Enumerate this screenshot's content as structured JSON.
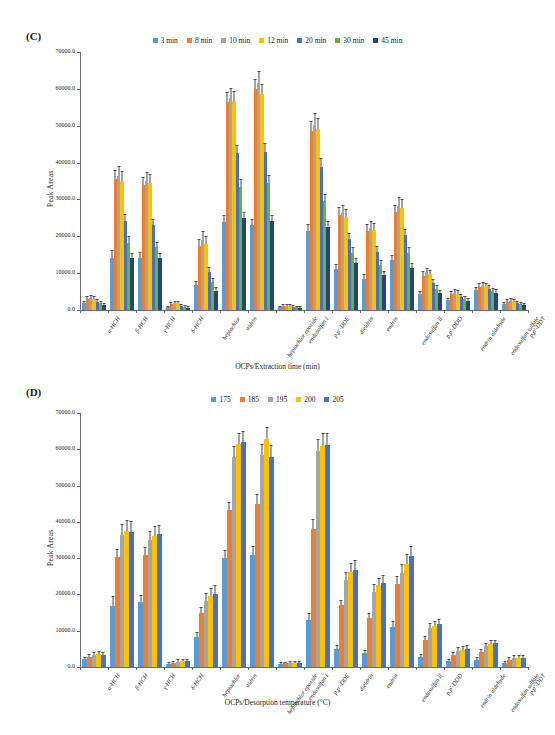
{
  "figure": {
    "panels": [
      {
        "label": "(C)",
        "xlabel": "OCPs/Extraction time (min)",
        "ylabel": "Peak Areas"
      },
      {
        "label": "(D)",
        "xlabel": "OCPs/Desorption temperature (°C)",
        "ylabel": "Peak Areas"
      }
    ]
  },
  "chart_data": [
    {
      "type": "bar",
      "panel": "(C)",
      "title": "",
      "xlabel": "OCPs/Extraction time (min)",
      "ylabel": "Peak Areas",
      "ylim": [
        0,
        70000
      ],
      "yticks": [
        "0.0",
        "10000.0",
        "20000.0",
        "30000.0",
        "40000.0",
        "50000.0",
        "60000.0",
        "70000.0"
      ],
      "grid": false,
      "legend_position": "top-center",
      "categories": [
        "α-HCH",
        "β-HCH",
        "γ-HCH",
        "δ-HCH",
        "heptachlor",
        "aldrin",
        "heptachlor epoxide",
        "endosulfan I",
        "p,p'-DDE",
        "dieldrin",
        "endrin",
        "endosulfan II",
        "p,p'-DDD",
        "endrin aldehyde",
        "endosulfan sulfate",
        "p,p'-DDT"
      ],
      "series": [
        {
          "name": "3 min",
          "color": "#5b9bd5",
          "values": [
            1900,
            14200,
            14200,
            700,
            6800,
            24000,
            23000,
            700,
            21500,
            11000,
            8500,
            13500,
            4300,
            2600,
            5300,
            1500
          ],
          "errors": [
            400,
            1900,
            1400,
            200,
            900,
            1500,
            1400,
            200,
            1500,
            1200,
            900,
            1100,
            500,
            400,
            600,
            300
          ]
        },
        {
          "name": "8 min",
          "color": "#ed7d31",
          "values": [
            3000,
            35500,
            34000,
            1700,
            17500,
            56500,
            60000,
            1100,
            48500,
            25800,
            21500,
            26500,
            9300,
            4300,
            6300,
            2300
          ],
          "errors": [
            500,
            2200,
            1900,
            300,
            1600,
            2400,
            2500,
            250,
            2600,
            1800,
            1500,
            1800,
            900,
            600,
            700,
            400
          ]
        },
        {
          "name": "10 min",
          "color": "#a5a5a5",
          "values": [
            3200,
            36300,
            35000,
            1900,
            19000,
            57500,
            61500,
            1200,
            50200,
            26200,
            22300,
            28300,
            10200,
            4600,
            6600,
            2500
          ],
          "errors": [
            500,
            2600,
            2200,
            350,
            2100,
            2600,
            3000,
            250,
            3000,
            2000,
            1600,
            2200,
            1000,
            700,
            800,
            450
          ]
        },
        {
          "name": "12 min",
          "color": "#ffc000",
          "values": [
            3100,
            35000,
            34500,
            1800,
            18000,
            56800,
            58500,
            1100,
            49000,
            25200,
            21800,
            27800,
            9700,
            4400,
            6400,
            2400
          ],
          "errors": [
            450,
            2400,
            2000,
            300,
            1800,
            2400,
            2600,
            250,
            2700,
            1900,
            1500,
            2000,
            950,
            650,
            750,
            400
          ]
        },
        {
          "name": "20 min",
          "color": "#4472c4",
          "values": [
            2200,
            24200,
            23000,
            1100,
            10200,
            42500,
            43000,
            900,
            38800,
            19200,
            15800,
            20300,
            7300,
            3500,
            5700,
            1900
          ],
          "errors": [
            400,
            1700,
            1500,
            250,
            1100,
            2000,
            2000,
            200,
            2100,
            1500,
            1200,
            1500,
            800,
            550,
            700,
            350
          ]
        },
        {
          "name": "30 min",
          "color": "#70ad47",
          "values": [
            1800,
            18200,
            17000,
            900,
            7600,
            33500,
            34500,
            700,
            29500,
            15500,
            12200,
            15500,
            5800,
            3000,
            5100,
            1600
          ],
          "errors": [
            350,
            1500,
            1300,
            200,
            900,
            1800,
            1800,
            180,
            1800,
            1300,
            1000,
            1300,
            700,
            500,
            650,
            300
          ]
        },
        {
          "name": "45 min",
          "color": "#264478",
          "values": [
            1400,
            14000,
            14200,
            600,
            5100,
            25000,
            24200,
            600,
            22500,
            12800,
            9600,
            11500,
            4500,
            2500,
            4700,
            1300
          ],
          "errors": [
            300,
            1200,
            1100,
            180,
            800,
            1400,
            1400,
            150,
            1500,
            1100,
            800,
            1000,
            600,
            450,
            600,
            280
          ]
        }
      ]
    },
    {
      "type": "bar",
      "panel": "(D)",
      "title": "",
      "xlabel": "OCPs/Desorption temperature (°C)",
      "ylabel": "Peak Areas",
      "ylim": [
        0,
        70000
      ],
      "yticks": [
        "0.0",
        "10000.0",
        "20000.0",
        "30000.0",
        "40000.0",
        "50000.0",
        "60000.0",
        "70000.0"
      ],
      "grid": false,
      "legend_position": "top-center",
      "categories": [
        "α-HCH",
        "β-HCH",
        "γ-HCH",
        "δ-HCH",
        "heptachlor",
        "aldrin",
        "heptachlor epoxide",
        "endosulfan I",
        "p,p'-DDE",
        "dieldrin",
        "endrin",
        "endosulfan II",
        "p,p'-DDD",
        "endrin aldehyde",
        "endosulfan sulfate",
        "p,p'-DDT"
      ],
      "series": [
        {
          "name": "175",
          "color": "#5b9bd5",
          "values": [
            2200,
            16800,
            17800,
            900,
            8300,
            30000,
            31000,
            900,
            13000,
            5000,
            3800,
            11000,
            2800,
            1700,
            2000,
            1000
          ],
          "errors": [
            400,
            2600,
            1800,
            200,
            1100,
            2100,
            2200,
            200,
            1600,
            900,
            700,
            1400,
            500,
            300,
            400,
            250
          ]
        },
        {
          "name": "185",
          "color": "#ed7d31",
          "values": [
            2800,
            30200,
            30800,
            1200,
            14800,
            43200,
            45000,
            1000,
            38000,
            17000,
            13500,
            23000,
            7500,
            3300,
            4200,
            2000
          ],
          "errors": [
            450,
            2000,
            2000,
            250,
            1400,
            2000,
            2300,
            200,
            2500,
            1300,
            1000,
            1800,
            800,
            500,
            600,
            400
          ]
        },
        {
          "name": "195",
          "color": "#a5a5a5",
          "values": [
            3300,
            36500,
            35000,
            1500,
            18300,
            58000,
            58500,
            1100,
            59500,
            24000,
            20800,
            26000,
            10800,
            4500,
            5700,
            2500
          ],
          "errors": [
            500,
            2600,
            2300,
            300,
            1800,
            2600,
            2800,
            250,
            3000,
            2000,
            1700,
            2200,
            1000,
            650,
            750,
            450
          ]
        },
        {
          "name": "200",
          "color": "#ffc000",
          "values": [
            3500,
            37500,
            36200,
            1600,
            19500,
            61500,
            62800,
            1200,
            61000,
            26200,
            22500,
            28500,
            11300,
            4800,
            6300,
            2600
          ],
          "errors": [
            550,
            2800,
            2400,
            300,
            2000,
            2800,
            3200,
            250,
            3200,
            2200,
            1800,
            2500,
            1100,
            700,
            800,
            480
          ]
        },
        {
          "name": "205",
          "color": "#4472c4",
          "values": [
            3400,
            37200,
            36600,
            1700,
            20200,
            62000,
            58000,
            1100,
            61200,
            26800,
            23200,
            30500,
            11800,
            5000,
            6500,
            2500
          ],
          "errors": [
            520,
            2700,
            2300,
            320,
            2100,
            2800,
            3000,
            250,
            3100,
            2300,
            1900,
            2600,
            1100,
            700,
            800,
            460
          ]
        }
      ]
    }
  ]
}
